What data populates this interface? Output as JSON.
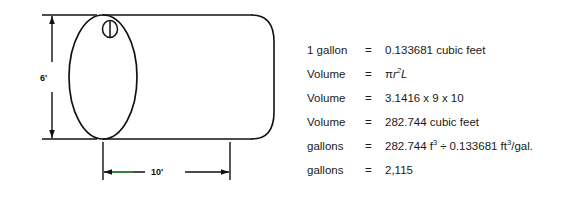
{
  "diagram": {
    "name": "horizontal-cylindrical-tank",
    "height_dimension_label": "6'",
    "length_dimension_label": "10'",
    "hatch_icon": "tank-hatch-icon",
    "stroke_color": "#111111",
    "accent_color": "#2f8f3e",
    "background_color": "#ffffff"
  },
  "calculations": {
    "rows": [
      {
        "label": "1 gallon",
        "eq": "=",
        "value_text": "0.133681 cubic feet",
        "kind": "plain"
      },
      {
        "label": "Volume",
        "eq": "=",
        "value_text": "πr2L",
        "kind": "formula",
        "formula": {
          "pi": "π",
          "r": "r",
          "exp": "2",
          "L": "L"
        }
      },
      {
        "label": "Volume",
        "eq": "=",
        "value_text": "3.1416 x 9 x 10",
        "kind": "plain"
      },
      {
        "label": "Volume",
        "eq": "=",
        "value_text": "282.744 cubic feet",
        "kind": "plain"
      },
      {
        "label": "gallons",
        "eq": "=",
        "value_text": "282.744 f3 ÷ 0.133681 ft3/gal.",
        "kind": "units",
        "units": {
          "a_num": "282.744 f",
          "a_exp": "3",
          "op": "÷",
          "b_num": "0.133681 ft",
          "b_exp": "3",
          "b_tail": "/gal."
        }
      },
      {
        "label": "gallons",
        "eq": "=",
        "value_text": "2,115",
        "kind": "plain"
      }
    ]
  }
}
